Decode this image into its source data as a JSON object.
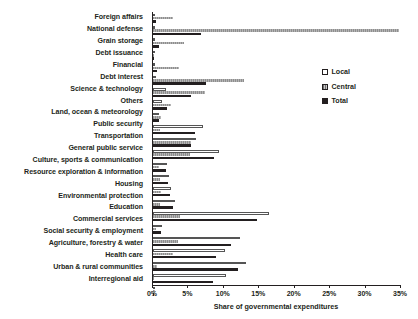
{
  "chart_data": {
    "type": "bar",
    "orientation": "horizontal",
    "title": "",
    "xlabel": "Share of governmental expenditures",
    "ylabel": "",
    "xlim": [
      0,
      35
    ],
    "xunit": "%",
    "grid": false,
    "legend_position": "top-right",
    "xticks": [
      "0%",
      "5%",
      "10%",
      "15%",
      "20%",
      "25%",
      "30%",
      "35%"
    ],
    "xtick_values": [
      0,
      5,
      10,
      15,
      20,
      25,
      30,
      35
    ],
    "categories": [
      "Foreign affairs",
      "National defense",
      "Grain storage",
      "Debt issuance",
      "Financial",
      "Debt interest",
      "Science & technology",
      "Others",
      "Land, ocean & meteorology",
      "Public security",
      "Transportation",
      "General public service",
      "Culture, sports & communication",
      "Resource exploration & information",
      "Housing",
      "Environmental protection",
      "Education",
      "Commercial services",
      "Social security & employment",
      "Agriculture, forestry & water",
      "Health care",
      "Urban & rural communities",
      "Interregional aid"
    ],
    "series": [
      {
        "name": "Local",
        "color": "#ffffff",
        "values": [
          0.1,
          0.0,
          0.2,
          0.0,
          0.1,
          0.4,
          1.8,
          1.2,
          0.9,
          7.0,
          6.1,
          9.3,
          2.0,
          2.3,
          2.6,
          3.1,
          16.4,
          1.3,
          12.3,
          10.1,
          13.1,
          10.3,
          0.2
        ]
      },
      {
        "name": "Central",
        "color": "#9a9a9a",
        "values": [
          2.8,
          34.7,
          4.4,
          0.2,
          3.7,
          12.8,
          7.3,
          2.6,
          1.1,
          1.0,
          5.3,
          5.2,
          0.8,
          1.0,
          1.1,
          1.0,
          3.8,
          0.4,
          3.5,
          2.8,
          0.6,
          0.2,
          0.3
        ]
      },
      {
        "name": "Total",
        "color": "#231f20",
        "values": [
          0.4,
          6.8,
          0.9,
          0.1,
          0.5,
          7.5,
          5.4,
          2.0,
          0.9,
          5.9,
          5.4,
          8.6,
          1.8,
          2.1,
          2.4,
          2.8,
          14.7,
          1.1,
          11.0,
          8.9,
          12.0,
          8.5,
          0.2
        ]
      }
    ]
  },
  "legend": {
    "items": [
      {
        "label": "Local"
      },
      {
        "label": "Central"
      },
      {
        "label": "Total"
      }
    ]
  }
}
